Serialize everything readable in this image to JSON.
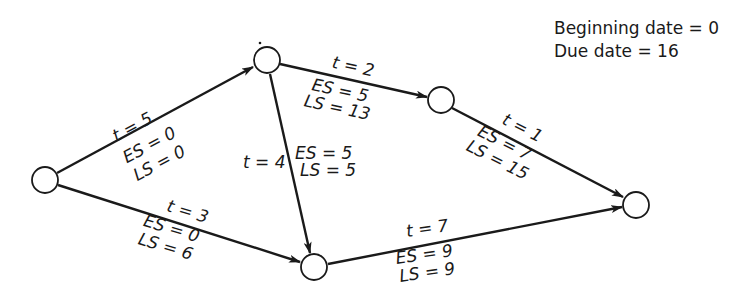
{
  "info": {
    "beginning": "Beginning date = 0",
    "due": "Due date = 16"
  },
  "nodes": [
    {
      "id": "n1",
      "cx": 45,
      "cy": 180
    },
    {
      "id": "n2",
      "cx": 267,
      "cy": 60
    },
    {
      "id": "n3",
      "cx": 441,
      "cy": 100
    },
    {
      "id": "n4",
      "cx": 314,
      "cy": 267
    },
    {
      "id": "n5",
      "cx": 636,
      "cy": 205
    }
  ],
  "edges": [
    {
      "id": "e12",
      "from": "n1",
      "to": "n2",
      "t": "t = 5",
      "es": "ES = 0",
      "ls": "LS = 0"
    },
    {
      "id": "e23",
      "from": "n2",
      "to": "n3",
      "t": "t = 2",
      "es": "ES = 5",
      "ls": "LS = 13"
    },
    {
      "id": "e24",
      "from": "n2",
      "to": "n4",
      "t": "t = 4",
      "es": "ES = 5",
      "ls": "LS = 5"
    },
    {
      "id": "e14",
      "from": "n1",
      "to": "n4",
      "t": "t = 3",
      "es": "ES = 0",
      "ls": "LS = 6"
    },
    {
      "id": "e35",
      "from": "n3",
      "to": "n5",
      "t": "t = 1",
      "es": "ES = 7",
      "ls": "LS = 15"
    },
    {
      "id": "e45",
      "from": "n4",
      "to": "n5",
      "t": "t = 7",
      "es": "ES = 9",
      "ls": "LS = 9"
    }
  ]
}
